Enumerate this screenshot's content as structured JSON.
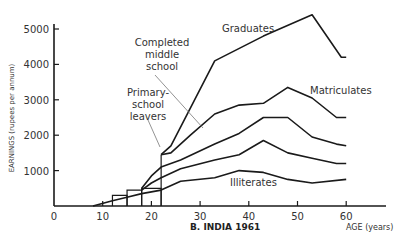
{
  "chart_data": {
    "type": "line",
    "title": "B. INDIA 1961",
    "xlabel": "AGE (years)",
    "ylabel": "EARNINGS (rupees per annum)",
    "xlim": [
      0,
      68
    ],
    "ylim": [
      0,
      5400
    ],
    "x_ticks": [
      0,
      10,
      20,
      30,
      40,
      50,
      60
    ],
    "y_ticks": [
      1000,
      2000,
      3000,
      4000,
      5000
    ],
    "grid": false,
    "legend": "inline labels",
    "series": [
      {
        "name": "Graduates",
        "points": [
          [
            22,
            1450
          ],
          [
            24,
            1700
          ],
          [
            33,
            4100
          ],
          [
            43,
            4800
          ],
          [
            53,
            5400
          ],
          [
            59,
            4200
          ],
          [
            60,
            4200
          ]
        ]
      },
      {
        "name": "Matriculates",
        "points": [
          [
            22,
            1450
          ],
          [
            24,
            1500
          ],
          [
            28,
            2000
          ],
          [
            33,
            2600
          ],
          [
            38,
            2850
          ],
          [
            43,
            2900
          ],
          [
            48,
            3350
          ],
          [
            53,
            3050
          ],
          [
            58,
            2500
          ],
          [
            60,
            2500
          ]
        ]
      },
      {
        "name": "Completed middle school",
        "points": [
          [
            18,
            500
          ],
          [
            20,
            850
          ],
          [
            22,
            1100
          ],
          [
            26,
            1300
          ],
          [
            33,
            1750
          ],
          [
            38,
            2050
          ],
          [
            43,
            2500
          ],
          [
            48,
            2500
          ],
          [
            53,
            1950
          ],
          [
            58,
            1750
          ],
          [
            60,
            1700
          ]
        ]
      },
      {
        "name": "Primary-school leavers",
        "points": [
          [
            18,
            450
          ],
          [
            20,
            650
          ],
          [
            22,
            800
          ],
          [
            26,
            1050
          ],
          [
            33,
            1300
          ],
          [
            38,
            1450
          ],
          [
            43,
            1850
          ],
          [
            48,
            1500
          ],
          [
            53,
            1350
          ],
          [
            58,
            1200
          ],
          [
            60,
            1200
          ]
        ]
      },
      {
        "name": "Illiterates",
        "points": [
          [
            8,
            0
          ],
          [
            12,
            150
          ],
          [
            15,
            250
          ],
          [
            18,
            350
          ],
          [
            22,
            450
          ],
          [
            26,
            700
          ],
          [
            33,
            800
          ],
          [
            38,
            1000
          ],
          [
            43,
            950
          ],
          [
            48,
            750
          ],
          [
            53,
            650
          ],
          [
            60,
            750
          ]
        ]
      }
    ],
    "bars": [
      {
        "x0": 12,
        "x1": 15,
        "y": 300
      },
      {
        "x0": 15,
        "x1": 18,
        "y": 450
      },
      {
        "x0": 18,
        "x1": 22,
        "y": 500
      },
      {
        "x0": 22,
        "x1": 22,
        "y": 1450
      }
    ],
    "labels": {
      "graduates": "Graduates",
      "matriculates": "Matriculates",
      "middle_line1": "Completed",
      "middle_line2": "middle",
      "middle_line3": "school",
      "primary_line1": "Primary-",
      "primary_line2": "school",
      "primary_line3": "leavers",
      "illiterates": "Illiterates"
    }
  }
}
